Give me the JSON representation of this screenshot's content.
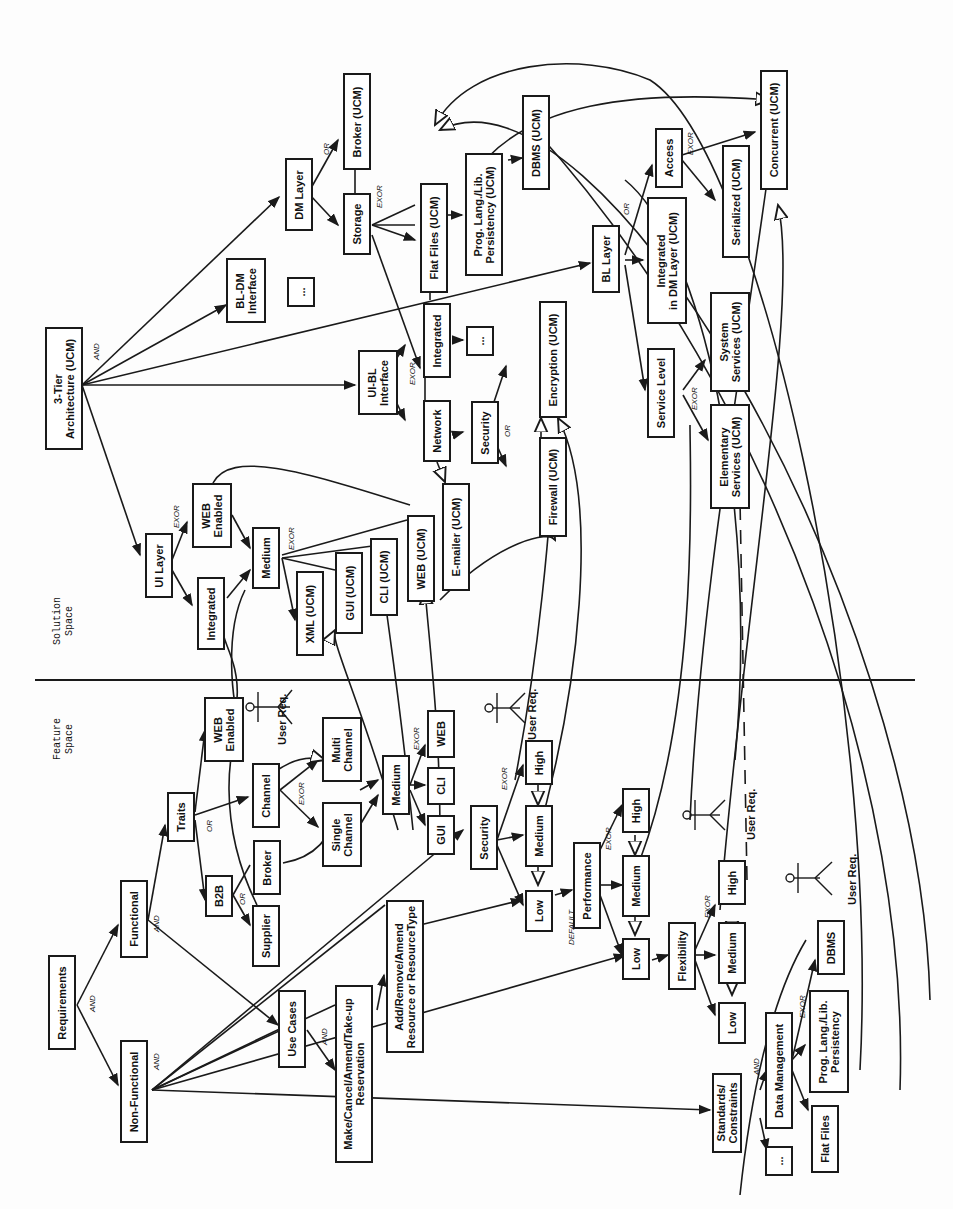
{
  "spaces": {
    "solution": "Solution\nSpace",
    "feature": "Feature\nSpace"
  },
  "nodes": {
    "requirements": "Requirements",
    "functional": "Functional",
    "non_functional": "Non-Functional",
    "traits": "Traits",
    "b2b": "B2B",
    "supplier": "Supplier",
    "broker": "Broker",
    "channel": "Channel",
    "web_enabled_f": "WEB\nEnabled",
    "single_channel": "Single\nChannel",
    "multi_channel": "Multi\nChannel",
    "medium_f": "Medium",
    "gui_f": "GUI",
    "cli_f": "CLI",
    "web_f": "WEB",
    "use_cases": "Use Cases",
    "make_cancel": "Make/Cancel/Amend/Take-up\nReservation",
    "add_remove": "Add/Remove/Amend\nResource or ResourceType",
    "security_f": "Security",
    "sec_high": "High",
    "sec_medium": "Medium",
    "sec_low": "Low",
    "performance": "Performance",
    "perf_high": "High",
    "perf_medium": "Medium",
    "perf_low": "Low",
    "flexibility": "Flexibility",
    "flex_high": "High",
    "flex_medium": "Medium",
    "flex_low": "Low",
    "standards": "Standards/\nConstraints",
    "std_more": "...",
    "data_mgmt": "Data Management",
    "flat_files_f": "Flat Files",
    "prog_lang_f": "Prog. Lang./Lib.\nPersistency",
    "dbms_f": "DBMS",
    "three_tier": "3-Tier\nArchitecture (UCM)",
    "ui_layer": "UI Layer",
    "integrated_ui": "Integrated",
    "web_enabled_s": "WEB\nEnabled",
    "medium_s": "Medium",
    "xml_ucm": "XML (UCM)",
    "gui_ucm": "GUI (UCM)",
    "cli_ucm": "CLI (UCM)",
    "web_ucm": "WEB (UCM)",
    "emailer_ucm": "E-mailer (UCM)",
    "ui_bl": "UI-BL\nInterface",
    "network": "Network",
    "integrated_net": "Integrated",
    "net_more": "...",
    "security_s": "Security",
    "firewall": "Firewall (UCM)",
    "encryption": "Encryption (UCM)",
    "bl_dm": "BL-DM\nInterface",
    "bldm_more": "...",
    "dm_layer": "DM Layer",
    "storage": "Storage",
    "broker_ucm": "Broker (UCM)",
    "flat_files_ucm": "Flat Files (UCM)",
    "prog_lang_ucm": "Prog. Lang./Lib.\nPersistency (UCM)",
    "dbms_ucm": "DBMS (UCM)",
    "bl_layer": "BL Layer",
    "service_level": "Service Level",
    "integrated_dm": "Integrated\nin DM Layer (UCM)",
    "system_services": "System\nServices (UCM)",
    "elementary_services": "Elementary\nServices (UCM)",
    "access": "Access",
    "serialized": "Serialized (UCM)",
    "concurrent": "Concurrent (UCM)"
  },
  "labels": {
    "and": "AND",
    "or": "OR",
    "exor": "EXOR",
    "default": "DEFAULT",
    "user_req": "User Req."
  },
  "colors": {
    "stroke": "#1a1a1a",
    "background": "#fdfdfd"
  }
}
